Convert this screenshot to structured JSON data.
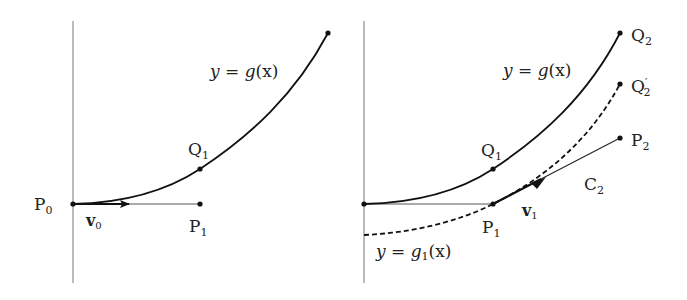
{
  "figure": {
    "left_panel": {
      "curve_label": "y = g(x)",
      "points": {
        "P0": "P0",
        "P1": "P1",
        "Q1": "Q1"
      },
      "vector_label": "v0"
    },
    "right_panel": {
      "curve_label": "y = g(x)",
      "dashed_curve_label": "y = g1(x)",
      "points": {
        "P1": "P1",
        "Q1": "Q1",
        "Q2": "Q2",
        "Q2_prime": "Q2′",
        "P2": "P2"
      },
      "vector_label": "v1",
      "segment_label": "C2"
    },
    "colors": {
      "ink": "#111111",
      "axis": "#666666"
    }
  },
  "text": {
    "l_y": "y",
    "l_eq": " = ",
    "l_g": "g",
    "l_args": "(x)",
    "r_y": "y",
    "r_eq": " = ",
    "r_g": "g",
    "r_args": "(x)",
    "g1_y": "y",
    "g1_eq": " = ",
    "g1_g": "g",
    "g1_sub": "1",
    "g1_args": "(x)",
    "P": "P",
    "Q": "Q",
    "C": "C",
    "v": "v",
    "sub0": "0",
    "sub1": "1",
    "sub2": "2",
    "prime": "′"
  }
}
